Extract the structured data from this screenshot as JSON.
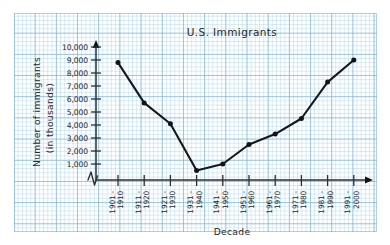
{
  "chart_data": {
    "type": "line",
    "title": "U.S. Immigrants",
    "xlabel": "Decade",
    "ylabel": "Number of immigrants (in thousands)",
    "ylabel_line1": "Number of immigrants",
    "ylabel_line2": "(in thousands)",
    "categories": [
      "1901 - 1910",
      "1911 - 1920",
      "1921 - 1930",
      "1931 - 1940",
      "1941 - 1950",
      "1951 - 1960",
      "1961 - 1970",
      "1971 - 1980",
      "1981 - 1990",
      "1991 - 2000"
    ],
    "category_lines": [
      [
        "1901 -",
        "1910"
      ],
      [
        "1911 -",
        "1920"
      ],
      [
        "1921 -",
        "1930"
      ],
      [
        "1931 -",
        "1940"
      ],
      [
        "1941 -",
        "1950"
      ],
      [
        "1951 -",
        "1960"
      ],
      [
        "1961 -",
        "1970"
      ],
      [
        "1971 -",
        "1980"
      ],
      [
        "1981 -",
        "1990"
      ],
      [
        "1991 -",
        "2000"
      ]
    ],
    "values": [
      8800,
      5700,
      4100,
      500,
      1000,
      2500,
      3300,
      4500,
      7300,
      9000
    ],
    "ytick_labels": [
      "10,000",
      "9,000",
      "8,000",
      "7,000",
      "6,000",
      "5,000",
      "4,000",
      "3,000",
      "2,000",
      "1,000"
    ],
    "ytick_values": [
      10000,
      9000,
      8000,
      7000,
      6000,
      5000,
      4000,
      3000,
      2000,
      1000
    ],
    "ylim": [
      0,
      10000
    ],
    "grid": true,
    "grid_style": "graph-paper",
    "legend": "none",
    "axis_break": true,
    "colors": {
      "line": "#15181b",
      "marker": "#111417",
      "axis": "#2b2f33",
      "grid_major": "#78afcd",
      "grid_minor": "#96c6de",
      "paper": "#fdfeff",
      "page": "#ffffff"
    }
  }
}
